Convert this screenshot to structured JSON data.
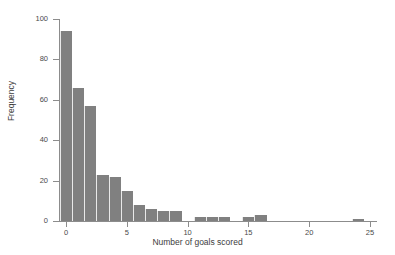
{
  "chart_data": {
    "type": "bar",
    "title": "",
    "xlabel": "Number of goals scored",
    "ylabel": "Frequency",
    "xlim": [
      -0.5,
      25.5
    ],
    "ylim": [
      0,
      100
    ],
    "grid": false,
    "legend": null,
    "bar_color": "#808080",
    "bin_width": 1,
    "xticks": [
      0,
      5,
      10,
      15,
      20,
      25
    ],
    "yticks": [
      0,
      20,
      40,
      60,
      80,
      100
    ],
    "categories": [
      0,
      1,
      2,
      3,
      4,
      5,
      6,
      7,
      8,
      9,
      10,
      11,
      12,
      13,
      14,
      15,
      16,
      17,
      18,
      19,
      20,
      21,
      22,
      23,
      24,
      25
    ],
    "values": [
      94,
      66,
      57,
      23,
      22,
      15,
      8,
      6,
      5,
      5,
      0,
      2,
      2,
      2,
      0,
      2,
      3,
      0,
      0,
      0,
      0,
      0,
      0,
      0,
      1,
      0
    ]
  },
  "axes": {
    "x_title": "Number of goals scored",
    "y_title": "Frequency",
    "x_tick_labels": [
      "0",
      "5",
      "10",
      "15",
      "20",
      "25"
    ],
    "y_tick_labels": [
      "0",
      "20",
      "40",
      "60",
      "80",
      "100"
    ]
  }
}
